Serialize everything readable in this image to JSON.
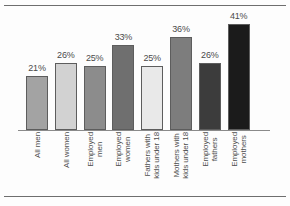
{
  "chart_data": {
    "type": "bar",
    "title": "",
    "subtitle": "",
    "xlabel": "",
    "ylabel": "",
    "ylim": [
      0,
      45
    ],
    "grid": false,
    "legend": null,
    "categories": [
      "All men",
      "All women",
      "Employed men",
      "Employed women",
      "Fathers with kids under 18",
      "Mothers with kids under 18",
      "Employed fathers",
      "Employed mothers"
    ],
    "category_lines": [
      [
        "All men"
      ],
      [
        "All women"
      ],
      [
        "Employed",
        "men"
      ],
      [
        "Employed",
        "women"
      ],
      [
        "Fathers with",
        "kids under 18"
      ],
      [
        "Mothers with",
        "kids under 18"
      ],
      [
        "Employed",
        "fathers"
      ],
      [
        "Employed",
        "mothers"
      ]
    ],
    "values": [
      21,
      26,
      25,
      33,
      25,
      36,
      26,
      41
    ],
    "data_labels": [
      "21%",
      "26%",
      "25%",
      "33%",
      "25%",
      "36%",
      "26%",
      "41%"
    ],
    "bar_colors": [
      "#a3a3a3",
      "#d2d2d2",
      "#8c8c8c",
      "#6f6f6f",
      "#e9e9e9",
      "#7d7d7d",
      "#3c3c3c",
      "#1b1b1b"
    ],
    "bar_border_color": "#5d5d5d",
    "axis_color": "#8a8a8a",
    "rule_color": "#6e6e6e",
    "value_text_color": "#4a4a4a",
    "label_text_color": "#4f4f4f"
  }
}
